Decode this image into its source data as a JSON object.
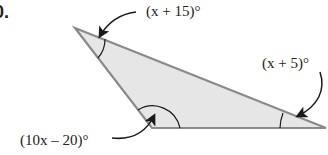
{
  "problem": {
    "number_visible": "0."
  },
  "triangle": {
    "fill": "#e6e6e6",
    "stroke": "#8a8a8a",
    "vertices": {
      "top_left": [
        75,
        28
      ],
      "bottom_left": [
        152,
        128
      ],
      "right": [
        326,
        128
      ]
    }
  },
  "angles": {
    "top": {
      "label": "(x + 15)°"
    },
    "right": {
      "label": "(x + 5)°"
    },
    "bottom_left": {
      "label": "(10x – 20)°"
    }
  },
  "colors": {
    "arrow": "#1a1a1a",
    "text": "#222222"
  }
}
